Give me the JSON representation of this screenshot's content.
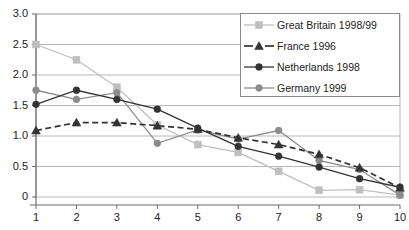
{
  "chart_data": {
    "type": "line",
    "title": "",
    "xlabel": "",
    "ylabel": "",
    "x": [
      1,
      2,
      3,
      4,
      5,
      6,
      7,
      8,
      9,
      10
    ],
    "categories": [
      "1",
      "2",
      "3",
      "4",
      "5",
      "6",
      "7",
      "8",
      "9",
      "10"
    ],
    "xtick_labels": [
      "1",
      "2",
      "3",
      "4",
      "5",
      "6",
      "7",
      "8",
      "9",
      "10"
    ],
    "ytick_labels": [
      "3.0",
      "2.5",
      "2.0",
      "1.5",
      "1.0",
      "0.5",
      "0"
    ],
    "ytick_values": [
      3.0,
      2.5,
      2.0,
      1.5,
      1.0,
      0.5,
      0
    ],
    "ylim": [
      0,
      3.0
    ],
    "xlim": [
      1,
      10
    ],
    "grid": "horizontal",
    "legend_position": "top-right",
    "series": [
      {
        "name": "Great Britain 1998/99",
        "marker": "square",
        "line_style": "solid",
        "color": "#bfbfbf",
        "values": [
          2.5,
          2.25,
          1.8,
          1.18,
          0.86,
          0.73,
          0.42,
          0.11,
          0.12,
          0.03
        ]
      },
      {
        "name": "France 1996",
        "marker": "triangle",
        "line_style": "dashed",
        "color": "#333333",
        "values": [
          1.09,
          1.22,
          1.22,
          1.17,
          1.11,
          0.97,
          0.86,
          0.7,
          0.48,
          0.15
        ]
      },
      {
        "name": "Netherlands 1998",
        "marker": "circle",
        "line_style": "solid",
        "color": "#333333",
        "values": [
          1.52,
          1.75,
          1.6,
          1.44,
          1.13,
          0.83,
          0.67,
          0.49,
          0.3,
          0.16
        ]
      },
      {
        "name": "Germany 1999",
        "marker": "circle",
        "line_style": "solid",
        "color": "#8c8c8c",
        "values": [
          1.75,
          1.6,
          1.71,
          0.88,
          1.1,
          0.95,
          1.09,
          0.6,
          0.45,
          0.03
        ]
      }
    ],
    "colors": {
      "axis": "#6b6b6b",
      "grid": "#b8b8b8",
      "great_britain": "#bfbfbf",
      "france": "#333333",
      "netherlands": "#333333",
      "germany": "#8c8c8c",
      "text": "#222222",
      "background": "#ffffff"
    }
  },
  "legend": {
    "items": [
      {
        "label": "Great Britain 1998/99"
      },
      {
        "label": "France 1996"
      },
      {
        "label": "Netherlands 1998"
      },
      {
        "label": "Germany 1999"
      }
    ]
  }
}
